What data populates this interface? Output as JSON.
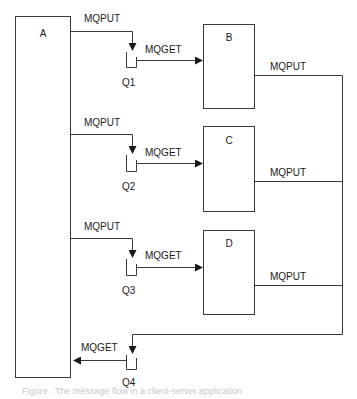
{
  "diagram": {
    "type": "message-queue-flow",
    "colors": {
      "stroke": "#3a3a3a",
      "text": "#1a1a1a",
      "background": "#ffffff"
    },
    "nodes": {
      "A": {
        "label": "A"
      },
      "B": {
        "label": "B"
      },
      "C": {
        "label": "C"
      },
      "D": {
        "label": "D"
      }
    },
    "queues": {
      "Q1": {
        "label": "Q1"
      },
      "Q2": {
        "label": "Q2"
      },
      "Q3": {
        "label": "Q3"
      },
      "Q4": {
        "label": "Q4"
      }
    },
    "edges": [
      {
        "from": "A",
        "to": "Q1",
        "label": "MQPUT"
      },
      {
        "from": "Q1",
        "to": "B",
        "label": "MQGET"
      },
      {
        "from": "A",
        "to": "Q2",
        "label": "MQPUT"
      },
      {
        "from": "Q2",
        "to": "C",
        "label": "MQGET"
      },
      {
        "from": "A",
        "to": "Q3",
        "label": "MQPUT"
      },
      {
        "from": "Q3",
        "to": "D",
        "label": "MQGET"
      },
      {
        "from": "B",
        "to": "Q4",
        "label": "MQPUT"
      },
      {
        "from": "C",
        "to": "Q4",
        "label": "MQPUT"
      },
      {
        "from": "D",
        "to": "Q4",
        "label": "MQPUT"
      },
      {
        "from": "Q4",
        "to": "A",
        "label": "MQGET"
      }
    ],
    "caption": "Figure . The message flow in a client-server application"
  }
}
